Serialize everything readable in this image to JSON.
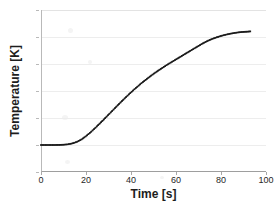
{
  "chart_data": {
    "type": "line",
    "title": "",
    "xlabel": "Time [s]",
    "ylabel": "Temperature [K]",
    "xlim": [
      0,
      100
    ],
    "ylim": [
      0,
      1800
    ],
    "xticks": [
      0,
      20,
      40,
      60,
      80,
      100
    ],
    "yticks": [
      0,
      300,
      600,
      900,
      1200,
      1500,
      1800
    ],
    "grid": true,
    "legend": null,
    "marker": "small filled square",
    "line_color": "#1a1a1a",
    "series": [
      {
        "name": "Temperature",
        "x": [
          0,
          2,
          4,
          6,
          8,
          10,
          12,
          14,
          16,
          18,
          20,
          22,
          24,
          26,
          28,
          30,
          32,
          34,
          36,
          38,
          40,
          42,
          44,
          46,
          48,
          50,
          52,
          54,
          56,
          58,
          60,
          62,
          64,
          66,
          68,
          70,
          72,
          74,
          76,
          78,
          80,
          82,
          84,
          86,
          88,
          90,
          92,
          93
        ],
        "y": [
          300,
          300,
          300,
          300,
          301,
          303,
          308,
          318,
          335,
          362,
          398,
          440,
          487,
          536,
          586,
          637,
          688,
          739,
          789,
          838,
          885,
          930,
          973,
          1014,
          1053,
          1090,
          1125,
          1158,
          1190,
          1221,
          1251,
          1281,
          1311,
          1341,
          1371,
          1401,
          1430,
          1456,
          1478,
          1496,
          1512,
          1525,
          1536,
          1545,
          1552,
          1557,
          1560,
          1562
        ]
      }
    ]
  },
  "axes": {
    "x_tick_labels": [
      "0",
      "20",
      "40",
      "60",
      "80",
      "100"
    ],
    "y_tick_labels": [
      "0",
      "300",
      "600",
      "900",
      "1200",
      "1500",
      "1800"
    ],
    "x_title": "Time [s]",
    "y_title": "Temperature [K]"
  },
  "colors": {
    "line": "#1a1a1a",
    "grid": "#ededed",
    "axis": "#b9b9b9",
    "text": "#262626",
    "background": "#ffffff"
  }
}
